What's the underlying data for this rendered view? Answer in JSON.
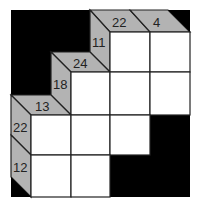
{
  "puzzle": {
    "type": "kakuro",
    "colors": {
      "background_block": "#000000",
      "clue_strip": "#b3b3b3",
      "cell_fill": "#ffffff",
      "grid_line": "#222222"
    },
    "column_clues": [
      {
        "label": "22",
        "column": 3
      },
      {
        "label": "4",
        "column": 4
      },
      {
        "label": "24",
        "column": 2
      },
      {
        "label": "13",
        "column": 1
      }
    ],
    "row_clues": [
      {
        "label": "11",
        "row": 1
      },
      {
        "label": "18",
        "row": 2
      },
      {
        "label": "22",
        "row": 3
      },
      {
        "label": "12",
        "row": 4
      }
    ],
    "cells": [
      {
        "row": 1,
        "col": 3,
        "value": ""
      },
      {
        "row": 1,
        "col": 4,
        "value": ""
      },
      {
        "row": 2,
        "col": 2,
        "value": ""
      },
      {
        "row": 2,
        "col": 3,
        "value": ""
      },
      {
        "row": 2,
        "col": 4,
        "value": ""
      },
      {
        "row": 3,
        "col": 1,
        "value": ""
      },
      {
        "row": 3,
        "col": 2,
        "value": ""
      },
      {
        "row": 3,
        "col": 3,
        "value": ""
      },
      {
        "row": 4,
        "col": 1,
        "value": ""
      },
      {
        "row": 4,
        "col": 2,
        "value": ""
      }
    ]
  }
}
